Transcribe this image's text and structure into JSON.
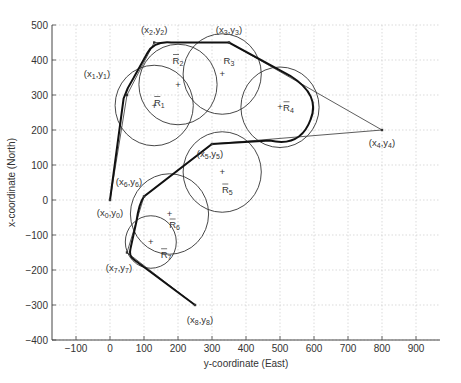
{
  "chart_data": {
    "type": "line",
    "title": "",
    "xlabel": "y-coordinate (East)",
    "ylabel": "x-coordinate (North)",
    "xlim": [
      -150,
      960
    ],
    "ylim": [
      -400,
      500
    ],
    "xticks": [
      -100,
      0,
      100,
      200,
      300,
      400,
      500,
      600,
      700,
      800,
      900
    ],
    "yticks": [
      -400,
      -300,
      -200,
      -100,
      0,
      100,
      200,
      300,
      400,
      500
    ],
    "grid": true,
    "waypoints": [
      {
        "label": "(x0,y0)",
        "x": 0,
        "y": 0
      },
      {
        "label": "(x1,y1)",
        "x": 50,
        "y": 300
      },
      {
        "label": "(x2,y2)",
        "x": 130,
        "y": 450
      },
      {
        "label": "(x3,y3)",
        "x": 350,
        "y": 450
      },
      {
        "label": "(x4,y4)",
        "x": 800,
        "y": 200
      },
      {
        "label": "(x5,y5)",
        "x": 300,
        "y": 160
      },
      {
        "label": "(x6,y6)",
        "x": 100,
        "y": 10
      },
      {
        "label": "(x7,y7)",
        "x": 50,
        "y": -150
      },
      {
        "label": "(x8,y8)",
        "x": 250,
        "y": -300
      }
    ],
    "circles": [
      {
        "label": "R1",
        "cx": 130,
        "cy": 270,
        "r": 115
      },
      {
        "label": "R2",
        "cx": 200,
        "cy": 330,
        "r": 115
      },
      {
        "label": "R3",
        "cx": 330,
        "cy": 360,
        "r": 115
      },
      {
        "label": "R4",
        "cx": 500,
        "cy": 265,
        "r": 115
      },
      {
        "label": "R5",
        "cx": 330,
        "cy": 80,
        "r": 115
      },
      {
        "label": "R6",
        "cx": 175,
        "cy": -40,
        "r": 115
      },
      {
        "label": "R7",
        "cx": 120,
        "cy": -120,
        "r": 75
      }
    ],
    "series": [
      {
        "name": "waypoint path (thin)",
        "style": "thin",
        "points": [
          [
            0,
            0
          ],
          [
            50,
            300
          ],
          [
            130,
            450
          ],
          [
            350,
            450
          ],
          [
            800,
            200
          ],
          [
            300,
            160
          ],
          [
            100,
            10
          ],
          [
            50,
            -150
          ],
          [
            250,
            -300
          ]
        ]
      },
      {
        "name": "smoothed path (thick)",
        "style": "thick"
      }
    ]
  }
}
